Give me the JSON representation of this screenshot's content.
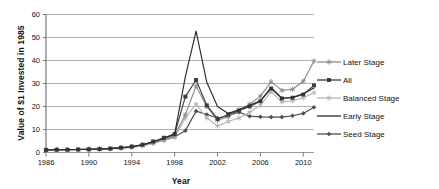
{
  "chart_data": {
    "type": "line",
    "title": "",
    "xlabel": "Year",
    "ylabel": "Value of $1 Invested in 1985",
    "xlim": [
      1986,
      2011
    ],
    "ylim": [
      0,
      60
    ],
    "ytick_labels": [
      "0",
      "10",
      "20",
      "30",
      "40",
      "50",
      "60"
    ],
    "ytick_values": [
      0,
      10,
      20,
      30,
      40,
      50,
      60
    ],
    "xtick_labels": [
      "1986",
      "1990",
      "1994",
      "1998",
      "2002",
      "2006",
      "2010"
    ],
    "xtick_values": [
      1986,
      1990,
      1994,
      1998,
      2002,
      2006,
      2010
    ],
    "grid": "horizontal",
    "legend_position": "right",
    "x": [
      1986,
      1987,
      1988,
      1989,
      1990,
      1991,
      1992,
      1993,
      1994,
      1995,
      1996,
      1997,
      1998,
      1999,
      2000,
      2001,
      2002,
      2003,
      2004,
      2005,
      2006,
      2007,
      2008,
      2009,
      2010,
      2011
    ],
    "series": [
      {
        "name": "Later Stage",
        "color": "#8c8c8c",
        "marker": "star",
        "values": [
          1.1,
          1.2,
          1.2,
          1.3,
          1.4,
          1.5,
          1.7,
          2.0,
          2.4,
          3.2,
          4.5,
          6.0,
          7.4,
          16.5,
          28.8,
          20.0,
          14.0,
          15.5,
          18.5,
          21.0,
          24.5,
          30.8,
          27.0,
          27.5,
          31.0,
          39.8
        ]
      },
      {
        "name": "All",
        "color": "#3d3d3d",
        "marker": "square",
        "values": [
          1.1,
          1.2,
          1.2,
          1.3,
          1.4,
          1.5,
          1.7,
          2.1,
          2.6,
          3.4,
          4.8,
          6.4,
          8.0,
          24.3,
          31.5,
          20.5,
          14.6,
          16.5,
          18.2,
          20.0,
          22.3,
          27.8,
          23.5,
          23.8,
          25.2,
          29.2
        ]
      },
      {
        "name": "Balanced Stage",
        "color": "#b5b5b5",
        "marker": "star",
        "values": [
          1.1,
          1.2,
          1.2,
          1.3,
          1.4,
          1.5,
          1.6,
          1.9,
          2.2,
          2.9,
          3.9,
          5.2,
          6.5,
          15.0,
          21.0,
          15.0,
          11.5,
          13.5,
          15.0,
          17.5,
          20.5,
          26.5,
          22.0,
          22.5,
          23.8,
          26.0
        ]
      },
      {
        "name": "Early Stage",
        "color": "#2b2b2b",
        "marker": "none",
        "values": [
          1.1,
          1.2,
          1.2,
          1.3,
          1.4,
          1.5,
          1.7,
          2.0,
          2.5,
          3.3,
          4.6,
          6.2,
          8.0,
          33.0,
          52.8,
          30.5,
          20.0,
          17.0,
          18.6,
          20.5,
          22.5,
          28.2,
          23.6,
          24.0,
          25.5,
          28.0
        ]
      },
      {
        "name": "Seed Stage",
        "color": "#4f4f4f",
        "marker": "diamond",
        "values": [
          1.1,
          1.2,
          1.2,
          1.3,
          1.4,
          1.5,
          1.7,
          2.0,
          2.3,
          3.0,
          4.0,
          5.4,
          6.8,
          9.5,
          18.0,
          16.5,
          15.0,
          16.0,
          17.5,
          15.8,
          15.5,
          15.4,
          15.4,
          16.0,
          17.0,
          19.7
        ]
      }
    ]
  },
  "legend": {
    "items": [
      {
        "label": "Later Stage"
      },
      {
        "label": "All"
      },
      {
        "label": "Balanced Stage"
      },
      {
        "label": "Early Stage"
      },
      {
        "label": "Seed Stage"
      }
    ]
  },
  "axes": {
    "y_title": "Value of $1 Invested in 1985",
    "x_title": "Year"
  }
}
